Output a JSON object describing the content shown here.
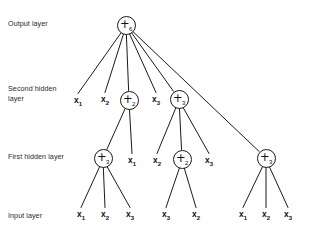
{
  "diagram": {
    "background_color": "#ffffff",
    "stroke_color": "#1a1a1a",
    "text_color": "#111111",
    "width": 311,
    "height": 237
  },
  "layer_labels": [
    {
      "id": "output-layer",
      "text": "Output layer",
      "x": 8,
      "y": 19
    },
    {
      "id": "second-hidden-layer",
      "text": "Second hidden\nlayer",
      "x": 8,
      "y": 84
    },
    {
      "id": "first-hidden-layer",
      "text": "First hidden layer",
      "x": 8,
      "y": 152
    },
    {
      "id": "input-layer",
      "text": "Input layer",
      "x": 8,
      "y": 211
    }
  ],
  "nodes": {
    "output": [
      {
        "id": "out-plus6",
        "type": "op",
        "op": "+",
        "subscript": "6",
        "x": 126,
        "y": 25
      }
    ],
    "second_hidden": [
      {
        "id": "sh-x1",
        "type": "var",
        "name": "x",
        "subscript": "1",
        "x": 78,
        "y": 101
      },
      {
        "id": "sh-x2",
        "type": "var",
        "name": "x",
        "subscript": "2",
        "x": 105,
        "y": 100
      },
      {
        "id": "sh-plus2",
        "type": "op",
        "op": "+",
        "subscript": "2",
        "x": 129,
        "y": 100
      },
      {
        "id": "sh-x3",
        "type": "var",
        "name": "x",
        "subscript": "3",
        "x": 156,
        "y": 100
      },
      {
        "id": "sh-plus3",
        "type": "op",
        "op": "+",
        "subscript": "3",
        "x": 179,
        "y": 99
      }
    ],
    "first_hidden": [
      {
        "id": "fh-plus3-left",
        "type": "op",
        "op": "+",
        "subscript": "3",
        "x": 103,
        "y": 158
      },
      {
        "id": "fh-x1",
        "type": "var",
        "name": "x",
        "subscript": "1",
        "x": 132,
        "y": 161
      },
      {
        "id": "fh-x2",
        "type": "var",
        "name": "x",
        "subscript": "2",
        "x": 157,
        "y": 161
      },
      {
        "id": "fh-plus2-mid",
        "type": "op",
        "op": "+",
        "subscript": "2",
        "x": 182,
        "y": 159
      },
      {
        "id": "fh-x3",
        "type": "var",
        "name": "x",
        "subscript": "3",
        "x": 209,
        "y": 161
      },
      {
        "id": "fh-plus3-right",
        "type": "op",
        "op": "+",
        "subscript": "3",
        "x": 266,
        "y": 158
      }
    ],
    "input": [
      {
        "id": "in-x1-a",
        "type": "var",
        "name": "x",
        "subscript": "1",
        "x": 81,
        "y": 215
      },
      {
        "id": "in-x2-a",
        "type": "var",
        "name": "x",
        "subscript": "2",
        "x": 105,
        "y": 215
      },
      {
        "id": "in-x3-a",
        "type": "var",
        "name": "x",
        "subscript": "3",
        "x": 130,
        "y": 215
      },
      {
        "id": "in-x3-b",
        "type": "var",
        "name": "x",
        "subscript": "3",
        "x": 166,
        "y": 215
      },
      {
        "id": "in-x2-b",
        "type": "var",
        "name": "x",
        "subscript": "2",
        "x": 196,
        "y": 215
      },
      {
        "id": "in-x1-c",
        "type": "var",
        "name": "x",
        "subscript": "1",
        "x": 243,
        "y": 215
      },
      {
        "id": "in-x2-c",
        "type": "var",
        "name": "x",
        "subscript": "2",
        "x": 266,
        "y": 215
      },
      {
        "id": "in-x3-c",
        "type": "var",
        "name": "x",
        "subscript": "3",
        "x": 288,
        "y": 215
      }
    ]
  },
  "edges": [
    {
      "from": "out-plus6",
      "to": "sh-x1"
    },
    {
      "from": "out-plus6",
      "to": "sh-x2"
    },
    {
      "from": "out-plus6",
      "to": "sh-plus2"
    },
    {
      "from": "out-plus6",
      "to": "sh-x3"
    },
    {
      "from": "out-plus6",
      "to": "sh-plus3"
    },
    {
      "from": "out-plus6",
      "to": "fh-plus3-right"
    },
    {
      "from": "sh-plus2",
      "to": "fh-plus3-left"
    },
    {
      "from": "sh-plus2",
      "to": "fh-x1"
    },
    {
      "from": "sh-plus3",
      "to": "fh-x2"
    },
    {
      "from": "sh-plus3",
      "to": "fh-plus2-mid"
    },
    {
      "from": "sh-plus3",
      "to": "fh-x3"
    },
    {
      "from": "fh-plus3-left",
      "to": "in-x1-a"
    },
    {
      "from": "fh-plus3-left",
      "to": "in-x2-a"
    },
    {
      "from": "fh-plus3-left",
      "to": "in-x3-a"
    },
    {
      "from": "fh-plus2-mid",
      "to": "in-x3-b"
    },
    {
      "from": "fh-plus2-mid",
      "to": "in-x2-b"
    },
    {
      "from": "fh-plus3-right",
      "to": "in-x1-c"
    },
    {
      "from": "fh-plus3-right",
      "to": "in-x2-c"
    },
    {
      "from": "fh-plus3-right",
      "to": "in-x3-c"
    }
  ]
}
